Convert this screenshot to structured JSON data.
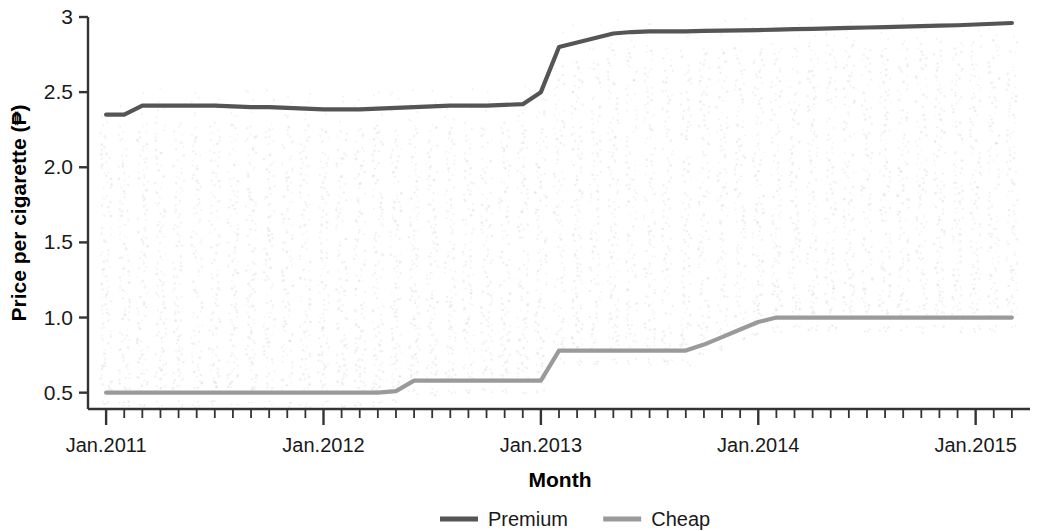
{
  "chart_data": {
    "type": "line",
    "title": "",
    "xlabel": "Month",
    "ylabel": "Price per cigarette (₱)",
    "currency_symbol": "₱",
    "grid": false,
    "legend_position": "bottom",
    "xlim": [
      "Jan.2011",
      "Mar.2015"
    ],
    "ylim": [
      0.38,
      3.0
    ],
    "ytick_labels": [
      "0.5",
      "1.0",
      "1.5",
      "2.0",
      "2.5",
      "3"
    ],
    "ytick_values": [
      0.5,
      1.0,
      1.5,
      2.0,
      2.5,
      3.0
    ],
    "xtick_labels": [
      "Jan.2011",
      "Jan.2012",
      "Jan.2013",
      "Jan.2014",
      "Jan.2015"
    ],
    "xtick_values": [
      0,
      12,
      24,
      36,
      48
    ],
    "x_minor_tick_interval_months": 1,
    "x_months": [
      "Jan.2011",
      "Feb.2011",
      "Mar.2011",
      "Apr.2011",
      "May.2011",
      "Jun.2011",
      "Jul.2011",
      "Aug.2011",
      "Sep.2011",
      "Oct.2011",
      "Nov.2011",
      "Dec.2011",
      "Jan.2012",
      "Feb.2012",
      "Mar.2012",
      "Apr.2012",
      "May.2012",
      "Jun.2012",
      "Jul.2012",
      "Aug.2012",
      "Sep.2012",
      "Oct.2012",
      "Nov.2012",
      "Dec.2012",
      "Jan.2013",
      "Feb.2013",
      "Mar.2013",
      "Apr.2013",
      "May.2013",
      "Jun.2013",
      "Jul.2013",
      "Aug.2013",
      "Sep.2013",
      "Oct.2013",
      "Nov.2013",
      "Dec.2013",
      "Jan.2014",
      "Feb.2014",
      "Mar.2014",
      "Apr.2014",
      "May.2014",
      "Jun.2014",
      "Jul.2014",
      "Aug.2014",
      "Sep.2014",
      "Oct.2014",
      "Nov.2014",
      "Dec.2014",
      "Jan.2015",
      "Feb.2015",
      "Mar.2015"
    ],
    "series": [
      {
        "name": "Premium",
        "color": "#555555",
        "values": [
          2.35,
          2.35,
          2.41,
          2.41,
          2.41,
          2.41,
          2.41,
          2.405,
          2.4,
          2.4,
          2.395,
          2.39,
          2.385,
          2.385,
          2.385,
          2.39,
          2.395,
          2.4,
          2.405,
          2.41,
          2.41,
          2.41,
          2.415,
          2.42,
          2.5,
          2.8,
          2.83,
          2.86,
          2.89,
          2.9,
          2.905,
          2.905,
          2.905,
          2.907,
          2.909,
          2.911,
          2.913,
          2.916,
          2.919,
          2.921,
          2.924,
          2.927,
          2.93,
          2.933,
          2.936,
          2.939,
          2.942,
          2.945,
          2.95,
          2.955,
          2.96
        ]
      },
      {
        "name": "Cheap",
        "color": "#9a9a9a",
        "values": [
          0.5,
          0.5,
          0.5,
          0.5,
          0.5,
          0.5,
          0.5,
          0.5,
          0.5,
          0.5,
          0.5,
          0.5,
          0.5,
          0.5,
          0.5,
          0.5,
          0.51,
          0.58,
          0.58,
          0.58,
          0.58,
          0.58,
          0.58,
          0.58,
          0.58,
          0.78,
          0.78,
          0.78,
          0.78,
          0.78,
          0.78,
          0.78,
          0.78,
          0.82,
          0.87,
          0.92,
          0.97,
          1.0,
          1.0,
          1.0,
          1.0,
          1.0,
          1.0,
          1.0,
          1.0,
          1.0,
          1.0,
          1.0,
          1.0,
          1.0,
          1.0
        ]
      }
    ],
    "scatter": {
      "name": "observed prices",
      "color": "#dcdcdc",
      "description": "light grey monthly scatter columns of individual observed cigarette prices",
      "monthly_ranges": [
        {
          "month": "Jan.2011",
          "low": 0.45,
          "high": 2.55
        },
        {
          "month": "Jan.2012",
          "low": 0.45,
          "high": 2.2
        },
        {
          "month": "Jul.2012",
          "low": 0.48,
          "high": 1.85
        },
        {
          "month": "Jan.2013",
          "low": 0.48,
          "high": 2.7
        },
        {
          "month": "Jan.2014",
          "low": 0.72,
          "high": 2.6
        },
        {
          "month": "Jan.2015",
          "low": 0.75,
          "high": 2.6
        }
      ]
    },
    "legend": [
      {
        "label": "Premium",
        "color": "#555555"
      },
      {
        "label": "Cheap",
        "color": "#9a9a9a"
      }
    ]
  }
}
